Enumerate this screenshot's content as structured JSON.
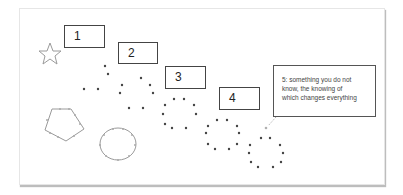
{
  "diagram": {
    "steps": [
      {
        "label": "1",
        "shape": "star"
      },
      {
        "label": "2",
        "shape": "scattered-dots"
      },
      {
        "label": "3",
        "shape": "dot-circle"
      },
      {
        "label": "4",
        "shape": "dot-circle"
      },
      {
        "label": "5: something you do not know, the knowing of which changes everything",
        "shape": "dot-circle"
      }
    ],
    "callout_lines": [
      "5: something you do not",
      "know, the knowing of",
      "which changes everything"
    ],
    "extra_shapes": [
      "pentagon-with-dots",
      "circle-with-dots"
    ],
    "colors": {
      "outline": "#9a9a9a",
      "dot": "#444444",
      "box_border": "#444444"
    }
  }
}
